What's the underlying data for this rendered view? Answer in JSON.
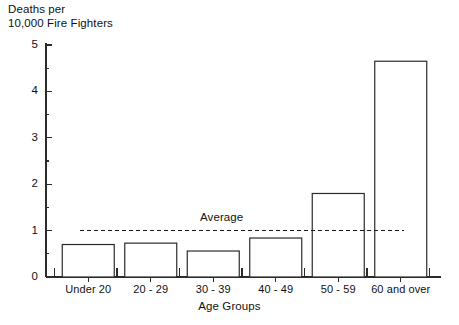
{
  "chart_data": {
    "type": "bar",
    "title": "",
    "ylabel": "Deaths per\n10,000 Fire Fighters",
    "xlabel": "Age Groups",
    "categories": [
      "Under 20",
      "20 - 29",
      "30 - 39",
      "40 - 49",
      "50 - 59",
      "60 and over"
    ],
    "values": [
      0.7,
      0.73,
      0.56,
      0.84,
      1.8,
      4.65
    ],
    "ylim": [
      0,
      5
    ],
    "ytick_labels": [
      "0",
      "1",
      "2",
      "3",
      "4",
      "5"
    ],
    "ytick_values": [
      0,
      1,
      2,
      3,
      4,
      5
    ],
    "yminor_values": [
      0.5,
      1.5,
      2.5,
      3.5,
      4.5
    ],
    "grid": false,
    "legend": "none",
    "annotations": [
      {
        "name": "average-line",
        "label": "Average",
        "value": 1.0,
        "style": "dashed"
      }
    ],
    "colors": {
      "bar_fill": "#ffffff",
      "bar_stroke": "#2b2b2b",
      "axis": "#2b2b2b",
      "text": "#111111",
      "average_line": "#1a1a1a"
    }
  }
}
